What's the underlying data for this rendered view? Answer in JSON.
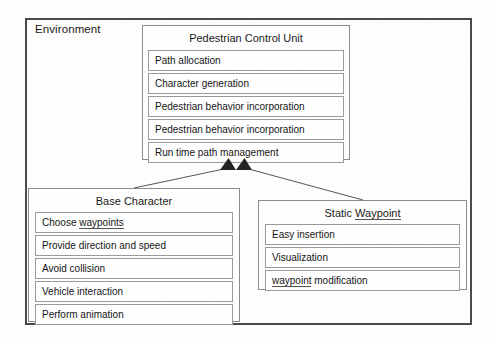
{
  "diagram": {
    "type": "uml-class-diagram",
    "outer_container": {
      "label": "Environment"
    },
    "boxes": [
      {
        "id": "pedestrian-control-unit",
        "title": "Pedestrian Control Unit",
        "rows": [
          "Path allocation",
          "Character generation",
          "Pedestrian behavior incorporation",
          "Pedestrian behavior incorporation",
          "Run time path management"
        ]
      },
      {
        "id": "base-character",
        "title": "Base Character",
        "rows": [
          "Choose waypoints",
          "Provide direction and speed",
          "Avoid collision",
          "Vehicle interaction",
          "Perform animation"
        ]
      },
      {
        "id": "static-waypoint",
        "title": "Static Waypoint",
        "rows": [
          "Easy insertion",
          "Visualization",
          "waypoint modification"
        ]
      }
    ],
    "connectors": [
      {
        "id": "base-character-to-pcu",
        "from": "base-character",
        "to": "pedestrian-control-unit",
        "arrow": "filled-triangle"
      },
      {
        "id": "static-waypoint-to-pcu",
        "from": "static-waypoint",
        "to": "pedestrian-control-unit",
        "arrow": "filled-triangle"
      }
    ],
    "colors": {
      "outer_border": "#4a4a4a",
      "box_border": "#8c8c8c",
      "row_border": "#9a9a9a",
      "text": "#151515",
      "background": "#fdfdfc"
    }
  }
}
